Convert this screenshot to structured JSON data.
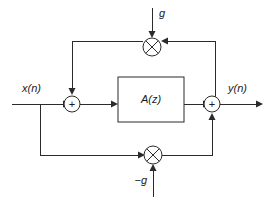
{
  "diagram": {
    "type": "signal-flow-block-diagram",
    "colors": {
      "line": "#2b2b2b",
      "text": "#1a1a1a",
      "background": "#ffffff"
    },
    "labels": {
      "input_signal": "x(n)",
      "output_signal": "y(n)",
      "gain_top": "g",
      "gain_bottom": "−g",
      "filter_block": "A(z)",
      "adder_left_symbol": "+",
      "adder_right_symbol": "+",
      "multiplier_top_symbol": "×",
      "multiplier_bottom_symbol": "×"
    },
    "nodes": [
      {
        "id": "input-terminal",
        "name": "x(n) input terminal",
        "label": "x(n)",
        "kind": "terminal",
        "x": 12,
        "y": 104
      },
      {
        "id": "adder-left",
        "name": "left summing junction",
        "label": "+",
        "kind": "adder",
        "x": 72,
        "y": 104,
        "r": 8
      },
      {
        "id": "filter-block",
        "name": "A(z) allpass filter block",
        "label": "A(z)",
        "kind": "block",
        "x": 118,
        "y": 77,
        "w": 66,
        "h": 45
      },
      {
        "id": "adder-right",
        "name": "right summing junction",
        "label": "+",
        "kind": "adder",
        "x": 212,
        "y": 104,
        "r": 8
      },
      {
        "id": "multiplier-top",
        "name": "top gain multiplier g",
        "label": "×",
        "kind": "multiplier",
        "x": 152,
        "y": 47,
        "r": 9
      },
      {
        "id": "multiplier-bottom",
        "name": "bottom gain multiplier -g",
        "label": "×",
        "kind": "multiplier",
        "x": 153,
        "y": 155,
        "r": 9
      },
      {
        "id": "output-terminal",
        "name": "y(n) output terminal",
        "label": "y(n)",
        "kind": "terminal",
        "x": 262,
        "y": 104
      }
    ],
    "edges": [
      {
        "id": "e-in-adderleft",
        "from": "input-terminal",
        "to": "adder-left",
        "name": "input to left adder"
      },
      {
        "id": "e-adderleft-block",
        "from": "adder-left",
        "to": "filter-block",
        "name": "left adder to A(z)"
      },
      {
        "id": "e-block-adderright",
        "from": "filter-block",
        "to": "adder-right",
        "name": "A(z) to right adder"
      },
      {
        "id": "e-adderright-out",
        "from": "adder-right",
        "to": "output-terminal",
        "name": "right adder to output"
      },
      {
        "id": "e-out-multtop",
        "from": "output-terminal",
        "to": "multiplier-top",
        "name": "output tap to top multiplier"
      },
      {
        "id": "e-multtop-adderleft",
        "from": "multiplier-top",
        "to": "adder-left",
        "name": "top multiplier feedback to left adder"
      },
      {
        "id": "e-in-multbottom",
        "from": "input-terminal",
        "to": "multiplier-bottom",
        "name": "input tap to bottom multiplier"
      },
      {
        "id": "e-multbottom-adderright",
        "from": "multiplier-bottom",
        "to": "adder-right",
        "name": "bottom multiplier feedforward to right adder"
      },
      {
        "id": "e-g-multtop",
        "from": "gain_top",
        "to": "multiplier-top",
        "name": "g coefficient into top multiplier"
      },
      {
        "id": "e-negg-multbottom",
        "from": "gain_bottom",
        "to": "multiplier-bottom",
        "name": "minus g coefficient into bottom multiplier"
      }
    ]
  }
}
